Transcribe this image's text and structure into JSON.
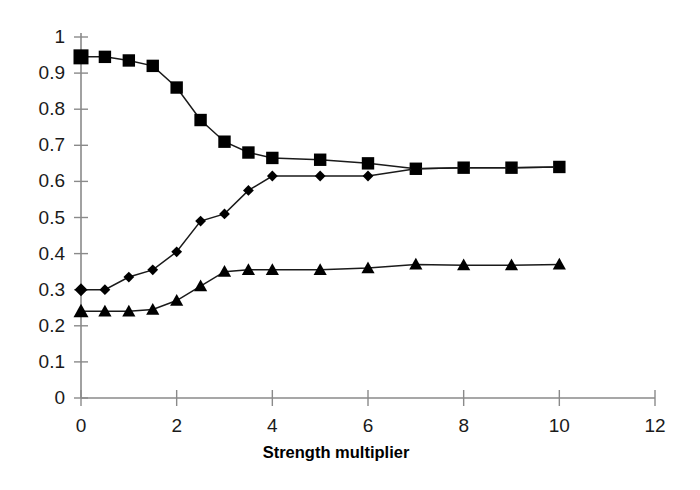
{
  "chart_data": {
    "type": "line",
    "title": "",
    "subtitle": "",
    "xlabel": "Strength multiplier",
    "ylabel": "",
    "xlim": [
      0,
      12
    ],
    "ylim": [
      0,
      1
    ],
    "xticks": [
      0,
      2,
      4,
      6,
      8,
      10,
      12
    ],
    "xtick_labels": [
      "0",
      "2",
      "4",
      "6",
      "8",
      "10",
      "12"
    ],
    "yticks": [
      0,
      0.1,
      0.2,
      0.3,
      0.4,
      0.5,
      0.6,
      0.7,
      0.8,
      0.9,
      1
    ],
    "ytick_labels": [
      "0",
      "0.1",
      "0.2",
      "0.3",
      "0.4",
      "0.5",
      "0.6",
      "0.7",
      "0.8",
      "0.9",
      "1"
    ],
    "grid": false,
    "legend": null,
    "legend_position": "none",
    "annotations": [],
    "x": [
      0,
      0.5,
      1,
      1.5,
      2,
      2.5,
      3,
      3.5,
      4,
      5,
      6,
      7,
      8,
      9,
      10
    ],
    "series": [
      {
        "name": "series-squares",
        "marker": "square",
        "color": "#000000",
        "values": [
          0.945,
          0.945,
          0.935,
          0.92,
          0.86,
          0.77,
          0.71,
          0.68,
          0.665,
          0.66,
          0.65,
          0.635,
          0.638,
          0.638,
          0.64
        ]
      },
      {
        "name": "series-diamonds",
        "marker": "diamond",
        "color": "#000000",
        "values": [
          0.3,
          0.3,
          0.335,
          0.355,
          0.405,
          0.49,
          0.51,
          0.575,
          0.615,
          0.615,
          0.615,
          0.635,
          0.638,
          0.638,
          0.64
        ]
      },
      {
        "name": "series-triangles",
        "marker": "triangle",
        "color": "#000000",
        "values": [
          0.24,
          0.24,
          0.24,
          0.245,
          0.27,
          0.31,
          0.35,
          0.355,
          0.355,
          0.355,
          0.36,
          0.37,
          0.368,
          0.368,
          0.37
        ]
      }
    ]
  },
  "axis": {
    "x_title": "Strength multiplier"
  }
}
